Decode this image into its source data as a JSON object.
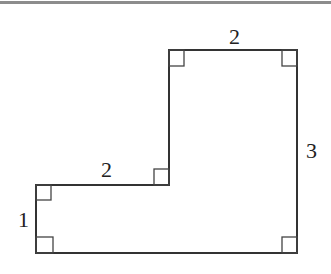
{
  "diagram": {
    "type": "L-shaped polygon with right-angle markers",
    "stroke_color": "#333333",
    "labels": {
      "top": "2",
      "right": "3",
      "step_top": "2",
      "left": "1"
    },
    "vertices": [
      [
        36,
        185
      ],
      [
        169,
        185
      ],
      [
        169,
        50
      ],
      [
        297,
        50
      ],
      [
        297,
        253
      ],
      [
        36,
        253
      ]
    ],
    "right_angle_markers": 6
  }
}
